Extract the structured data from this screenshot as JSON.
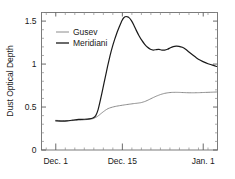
{
  "chart_data": {
    "type": "line",
    "title": "",
    "subtitle": "",
    "xlabel": "",
    "ylabel": "Dust Optical Depth",
    "grid": false,
    "legend_position": "top-left",
    "xlim": [
      0,
      37
    ],
    "ylim": [
      0,
      1.6
    ],
    "x_tick_values": [
      3,
      17,
      34
    ],
    "x_tick_labels": [
      "Dec. 1",
      "Dec. 15",
      "Jan. 1"
    ],
    "x_minor_count_per_interval": 7,
    "y_tick_values": [
      0,
      0.5,
      1,
      1.5
    ],
    "y_tick_labels": [
      "0",
      "0.5",
      "1",
      "1.5"
    ],
    "y_minor_step": 0.1,
    "x_unit": "days since Nov. 28",
    "series": [
      {
        "name": "Gusev",
        "color": "#8c8c8c",
        "width": 1.0,
        "x": [
          3.0,
          4.2,
          5.4,
          6.6,
          7.8,
          9.0,
          10.2,
          11.0,
          11.8,
          12.6,
          13.4,
          14.0,
          14.6,
          15.2,
          15.8,
          16.4,
          17.0,
          17.8,
          18.6,
          19.4,
          20.2,
          21.0,
          21.8,
          22.6,
          23.4,
          24.2,
          25.0,
          25.8,
          26.6,
          27.4,
          28.2,
          29.0,
          30.0,
          31.0,
          32.0,
          33.0,
          34.0,
          35.0,
          36.0,
          36.8
        ],
        "y": [
          0.345,
          0.342,
          0.341,
          0.343,
          0.347,
          0.352,
          0.358,
          0.368,
          0.392,
          0.428,
          0.462,
          0.482,
          0.494,
          0.503,
          0.51,
          0.516,
          0.521,
          0.528,
          0.534,
          0.54,
          0.545,
          0.552,
          0.566,
          0.586,
          0.608,
          0.628,
          0.645,
          0.658,
          0.666,
          0.67,
          0.671,
          0.67,
          0.668,
          0.666,
          0.666,
          0.667,
          0.669,
          0.671,
          0.673,
          0.675
        ]
      },
      {
        "name": "Meridiani",
        "color": "#1a1a1a",
        "width": 1.2,
        "x": [
          3.0,
          4.2,
          5.4,
          6.6,
          7.8,
          9.0,
          10.0,
          10.8,
          11.4,
          11.9,
          12.4,
          12.9,
          13.4,
          13.9,
          14.4,
          14.9,
          15.4,
          15.9,
          16.4,
          16.9,
          17.4,
          17.9,
          18.4,
          18.9,
          19.4,
          19.9,
          20.5,
          21.1,
          21.7,
          22.3,
          22.9,
          23.5,
          24.1,
          24.7,
          25.3,
          25.9,
          26.5,
          27.1,
          27.7,
          28.3,
          28.9,
          29.6,
          30.3,
          31.0,
          31.8,
          32.6,
          33.4,
          34.2,
          35.0,
          35.8,
          36.8
        ],
        "y": [
          0.34,
          0.337,
          0.339,
          0.348,
          0.356,
          0.358,
          0.362,
          0.372,
          0.4,
          0.47,
          0.585,
          0.715,
          0.845,
          0.975,
          1.095,
          1.2,
          1.29,
          1.37,
          1.44,
          1.505,
          1.545,
          1.553,
          1.54,
          1.505,
          1.455,
          1.395,
          1.33,
          1.275,
          1.23,
          1.195,
          1.172,
          1.163,
          1.168,
          1.17,
          1.163,
          1.162,
          1.172,
          1.19,
          1.203,
          1.208,
          1.206,
          1.195,
          1.172,
          1.14,
          1.105,
          1.072,
          1.045,
          1.022,
          1.004,
          0.99,
          0.972
        ]
      }
    ]
  },
  "legend": {
    "entries": [
      {
        "label": "Gusev",
        "color": "#8c8c8c"
      },
      {
        "label": "Meridiani",
        "color": "#1a1a1a"
      }
    ]
  },
  "axes": {
    "y_title": "Dust Optical Depth",
    "y_labels": [
      "1.5",
      "1",
      "0.5",
      "0"
    ],
    "x_labels": [
      "Dec. 1",
      "Dec. 15",
      "Jan. 1"
    ]
  }
}
